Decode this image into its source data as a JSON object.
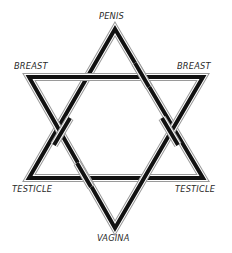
{
  "diagram": {
    "type": "hexagram",
    "labels": {
      "top": "PENIS",
      "upper_left": "BREAST",
      "upper_right": "BREAST",
      "lower_left": "TESTICLE",
      "lower_right": "TESTICLE",
      "bottom": "VAGINA"
    },
    "colors": {
      "stroke_outer": "#8a8a8a",
      "stroke_inner": "#111111",
      "background": "#ffffff",
      "text": "#2a2a2a"
    }
  }
}
